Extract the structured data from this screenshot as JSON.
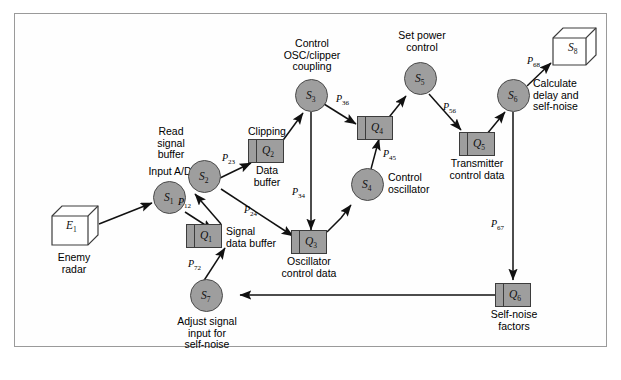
{
  "figure": {
    "type": "data-flow-diagram",
    "background": "#ffffff",
    "frame_color": "#9a9a9a",
    "process_fill": "#9e9e9e",
    "store_fill": "#9e9e9e",
    "external_fill": "#ffffff"
  },
  "nodes": [
    {
      "id": "E1",
      "symbol": "E",
      "index": "1",
      "shape": "cube",
      "label": "Enemy\nradar",
      "label_pos": "below"
    },
    {
      "id": "S1",
      "symbol": "S",
      "index": "1",
      "shape": "circle",
      "label": "Input A/D",
      "label_pos": "above"
    },
    {
      "id": "Q1",
      "symbol": "Q",
      "index": "1",
      "shape": "store",
      "label": "Signal\ndata buffer",
      "label_pos": "right"
    },
    {
      "id": "S2",
      "symbol": "S",
      "index": "2",
      "shape": "circle",
      "label": "Read\nsignal\nbuffer",
      "label_pos": "above-left"
    },
    {
      "id": "Q2",
      "symbol": "Q",
      "index": "2",
      "shape": "store",
      "label": "Clipping",
      "label_pos": "above",
      "label2": "Data\nbuffer"
    },
    {
      "id": "S3",
      "symbol": "S",
      "index": "3",
      "shape": "circle",
      "label": "Control\nOSC/clipper\ncoupling",
      "label_pos": "above"
    },
    {
      "id": "Q3",
      "symbol": "Q",
      "index": "3",
      "shape": "store",
      "label": "Oscillator\ncontrol data",
      "label_pos": "below"
    },
    {
      "id": "S4",
      "symbol": "S",
      "index": "4",
      "shape": "circle",
      "label": "Control\noscillator",
      "label_pos": "right"
    },
    {
      "id": "Q4",
      "symbol": "Q",
      "index": "4",
      "shape": "store",
      "label": "",
      "label_pos": "none"
    },
    {
      "id": "S5",
      "symbol": "S",
      "index": "5",
      "shape": "circle",
      "label": "Set power\ncontrol",
      "label_pos": "above"
    },
    {
      "id": "Q5",
      "symbol": "Q",
      "index": "5",
      "shape": "store",
      "label": "Transmitter\ncontrol data",
      "label_pos": "below"
    },
    {
      "id": "S6",
      "symbol": "S",
      "index": "6",
      "shape": "circle",
      "label": "Calculate\ndelay and\nself-noise",
      "label_pos": "right"
    },
    {
      "id": "S8",
      "symbol": "S",
      "index": "8",
      "shape": "cube",
      "label": "",
      "label_pos": "none"
    },
    {
      "id": "Q6",
      "symbol": "Q",
      "index": "6",
      "shape": "store",
      "label": "Self-noise\nfactors",
      "label_pos": "below"
    },
    {
      "id": "S7",
      "symbol": "S",
      "index": "7",
      "shape": "circle",
      "label": "Adjust signal\ninput for\nself-noise",
      "label_pos": "below"
    }
  ],
  "flows": [
    {
      "id": "E1_S1",
      "from": "E1",
      "to": "S1",
      "label": "",
      "sub": ""
    },
    {
      "id": "S1_Q1",
      "from": "S1",
      "to": "Q1",
      "label": "",
      "sub": ""
    },
    {
      "id": "P12",
      "from": "Q1",
      "to": "S2",
      "label": "P",
      "sub": "12"
    },
    {
      "id": "P23",
      "from": "S2",
      "to": "Q2",
      "label": "P",
      "sub": "23"
    },
    {
      "id": "P24",
      "from": "S2",
      "to": "Q3",
      "label": "P",
      "sub": "24"
    },
    {
      "id": "Q2_S3",
      "from": "Q2",
      "to": "S3",
      "label": "",
      "sub": ""
    },
    {
      "id": "P34",
      "from": "S3",
      "to": "Q3",
      "label": "P",
      "sub": "34"
    },
    {
      "id": "P36",
      "from": "S3",
      "to": "Q4",
      "label": "P",
      "sub": "36"
    },
    {
      "id": "Q3_S4",
      "from": "Q3",
      "to": "S4",
      "label": "",
      "sub": ""
    },
    {
      "id": "P45",
      "from": "S4",
      "to": "Q4",
      "label": "P",
      "sub": "45"
    },
    {
      "id": "Q4_S5",
      "from": "Q4",
      "to": "S5",
      "label": "",
      "sub": ""
    },
    {
      "id": "P56",
      "from": "S5",
      "to": "Q5",
      "label": "P",
      "sub": "56"
    },
    {
      "id": "Q5_S6",
      "from": "Q5",
      "to": "S6",
      "label": "",
      "sub": ""
    },
    {
      "id": "P68",
      "from": "S6",
      "to": "S8",
      "label": "P",
      "sub": "68"
    },
    {
      "id": "P67",
      "from": "S6",
      "to": "Q6",
      "label": "P",
      "sub": "67"
    },
    {
      "id": "Q6_S7",
      "from": "Q6",
      "to": "S7",
      "label": "",
      "sub": ""
    },
    {
      "id": "P72",
      "from": "S7",
      "to": "Q1",
      "label": "P",
      "sub": "72"
    }
  ],
  "text_labels": {
    "enemy_radar": "Enemy\nradar",
    "input_ad": "Input A/D",
    "signal_data_buffer": "Signal\ndata buffer",
    "read_signal_buffer": "Read\nsignal\nbuffer",
    "clipping": "Clipping",
    "data_buffer": "Data\nbuffer",
    "control_osc": "Control\nOSC/clipper\ncoupling",
    "oscillator_ctrl": "Oscillator\ncontrol data",
    "control_oscillator": "Control\noscillator",
    "set_power": "Set power\ncontrol",
    "transmitter_ctrl": "Transmitter\ncontrol data",
    "calculate_delay": "Calculate\ndelay and\nself-noise",
    "self_noise_factors": "Self-noise\nfactors",
    "adjust_signal": "Adjust signal\ninput for\nself-noise"
  },
  "node_text": {
    "E1": "E",
    "S1": "S",
    "Q1": "Q",
    "S2": "S",
    "Q2": "Q",
    "S3": "S",
    "Q3": "Q",
    "S4": "S",
    "Q4": "Q",
    "S5": "S",
    "Q5": "Q",
    "S6": "S",
    "S8": "S",
    "Q6": "Q",
    "S7": "S"
  },
  "node_sub": {
    "E1": "1",
    "S1": "1",
    "Q1": "1",
    "S2": "2",
    "Q2": "2",
    "S3": "3",
    "Q3": "3",
    "S4": "4",
    "Q4": "4",
    "S5": "5",
    "Q5": "5",
    "S6": "6",
    "S8": "8",
    "Q6": "6",
    "S7": "7"
  },
  "flow_text": {
    "P12": "P",
    "P23": "P",
    "P24": "P",
    "P34": "P",
    "P36": "P",
    "P45": "P",
    "P56": "P",
    "P67": "P",
    "P68": "P",
    "P72": "P"
  },
  "flow_sub": {
    "P12": "12",
    "P23": "23",
    "P24": "24",
    "P34": "34",
    "P36": "36",
    "P45": "45",
    "P56": "56",
    "P67": "67",
    "P68": "68",
    "P72": "72"
  }
}
